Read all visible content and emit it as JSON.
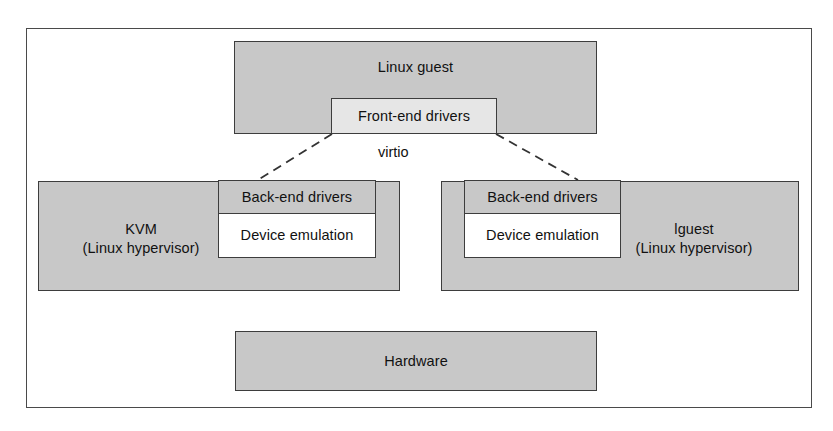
{
  "diagram": {
    "title_visible": false,
    "colors": {
      "block_fill": "#c8c8c8",
      "inner_fill": "#ffffff",
      "frontend_fill": "#e6e6e6",
      "border": "#3d3d3d",
      "frame_border": "#4a4a4a",
      "text": "#111111",
      "page_background": "#ffffff"
    },
    "guest": {
      "label": "Linux guest",
      "frontend_drivers": "Front-end drivers"
    },
    "connector": {
      "label": "virtio",
      "style": "dashed"
    },
    "hypervisors": [
      {
        "name": "KVM\n(Linux hypervisor)",
        "name_line1": "KVM",
        "name_line2": "(Linux hypervisor)",
        "backend_drivers": "Back-end drivers",
        "device_emulation": "Device emulation",
        "side": "left"
      },
      {
        "name": "lguest\n(Linux hypervisor)",
        "name_line1": "lguest",
        "name_line2": "(Linux hypervisor)",
        "backend_drivers": "Back-end drivers",
        "device_emulation": "Device emulation",
        "side": "right"
      }
    ],
    "hardware": {
      "label": "Hardware"
    }
  }
}
